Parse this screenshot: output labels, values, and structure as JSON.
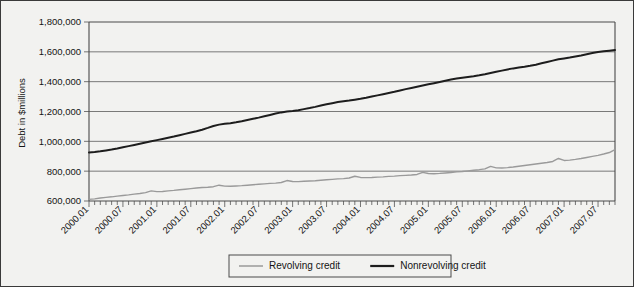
{
  "chart_data": {
    "type": "line",
    "title": "",
    "xlabel": "",
    "ylabel": "Debt in $millions",
    "ylim": [
      600000,
      1800000
    ],
    "yticks": [
      600000,
      800000,
      1000000,
      1200000,
      1400000,
      1600000,
      1800000
    ],
    "ytick_labels": [
      "600,000",
      "800,000",
      "1,000,000",
      "1,200,000",
      "1,400,000",
      "1,600,000",
      "1,800,000"
    ],
    "grid": true,
    "legend_position": "bottom-center",
    "x_tick_interval_months": 6,
    "x_minor_tick_interval_months": 1,
    "xtick_labels": [
      "2000.01",
      "2000.07",
      "2001.01",
      "2001.07",
      "2002.01",
      "2002.07",
      "2003.01",
      "2003.07",
      "2004.01",
      "2004.07",
      "2005.01",
      "2005.07",
      "2006.01",
      "2006.07",
      "2007.01",
      "2007.07"
    ],
    "x": [
      "2000.01",
      "2000.02",
      "2000.03",
      "2000.04",
      "2000.05",
      "2000.06",
      "2000.07",
      "2000.08",
      "2000.09",
      "2000.10",
      "2000.11",
      "2000.12",
      "2001.01",
      "2001.02",
      "2001.03",
      "2001.04",
      "2001.05",
      "2001.06",
      "2001.07",
      "2001.08",
      "2001.09",
      "2001.10",
      "2001.11",
      "2001.12",
      "2002.01",
      "2002.02",
      "2002.03",
      "2002.04",
      "2002.05",
      "2002.06",
      "2002.07",
      "2002.08",
      "2002.09",
      "2002.10",
      "2002.11",
      "2002.12",
      "2003.01",
      "2003.02",
      "2003.03",
      "2003.04",
      "2003.05",
      "2003.06",
      "2003.07",
      "2003.08",
      "2003.09",
      "2003.10",
      "2003.11",
      "2003.12",
      "2004.01",
      "2004.02",
      "2004.03",
      "2004.04",
      "2004.05",
      "2004.06",
      "2004.07",
      "2004.08",
      "2004.09",
      "2004.10",
      "2004.11",
      "2004.12",
      "2005.01",
      "2005.02",
      "2005.03",
      "2005.04",
      "2005.05",
      "2005.06",
      "2005.07",
      "2005.08",
      "2005.09",
      "2005.10",
      "2005.11",
      "2005.12",
      "2006.01",
      "2006.02",
      "2006.03",
      "2006.04",
      "2006.05",
      "2006.06",
      "2006.07",
      "2006.08",
      "2006.09",
      "2006.10",
      "2006.11",
      "2006.12",
      "2007.01",
      "2007.02",
      "2007.03",
      "2007.04",
      "2007.05",
      "2007.06",
      "2007.07",
      "2007.08",
      "2007.09",
      "2007.10"
    ],
    "series": [
      {
        "name": "Revolving credit",
        "color": "#9a9a9a",
        "values": [
          611000,
          614000,
          620000,
          624000,
          628000,
          633000,
          637000,
          641000,
          646000,
          650000,
          656000,
          668000,
          663000,
          664000,
          668000,
          671000,
          675000,
          679000,
          683000,
          687000,
          690000,
          692000,
          696000,
          706000,
          700000,
          699000,
          701000,
          703000,
          706000,
          709000,
          712000,
          715000,
          718000,
          720000,
          724000,
          737000,
          731000,
          730000,
          732000,
          734000,
          736000,
          739000,
          742000,
          745000,
          748000,
          750000,
          754000,
          766000,
          758000,
          757000,
          758000,
          760000,
          762000,
          765000,
          767000,
          770000,
          772000,
          774000,
          778000,
          792000,
          784000,
          783000,
          785000,
          788000,
          791000,
          795000,
          798000,
          802000,
          806000,
          810000,
          815000,
          832000,
          822000,
          821000,
          824000,
          828000,
          833000,
          838000,
          843000,
          848000,
          853000,
          858000,
          865000,
          885000,
          872000,
          874000,
          879000,
          885000,
          892000,
          899000,
          906000,
          915000,
          925000,
          945000
        ]
      },
      {
        "name": "Nonrevolving credit",
        "color": "#1d1d1d",
        "values": [
          925000,
          928000,
          933000,
          939000,
          945000,
          952000,
          960000,
          968000,
          976000,
          984000,
          992000,
          1000000,
          1008000,
          1016000,
          1024000,
          1032000,
          1041000,
          1050000,
          1059000,
          1068000,
          1078000,
          1090000,
          1103000,
          1112000,
          1118000,
          1122000,
          1128000,
          1135000,
          1143000,
          1151000,
          1159000,
          1168000,
          1177000,
          1186000,
          1194000,
          1200000,
          1204000,
          1209000,
          1216000,
          1223000,
          1231000,
          1240000,
          1248000,
          1256000,
          1263000,
          1268000,
          1273000,
          1279000,
          1285000,
          1292000,
          1300000,
          1308000,
          1316000,
          1324000,
          1332000,
          1341000,
          1350000,
          1358000,
          1366000,
          1374000,
          1382000,
          1390000,
          1398000,
          1406000,
          1414000,
          1421000,
          1427000,
          1432000,
          1437000,
          1443000,
          1450000,
          1458000,
          1466000,
          1474000,
          1482000,
          1489000,
          1495000,
          1500000,
          1506000,
          1514000,
          1523000,
          1532000,
          1541000,
          1550000,
          1556000,
          1562000,
          1569000,
          1576000,
          1584000,
          1592000,
          1599000,
          1604000,
          1608000,
          1612000
        ]
      }
    ]
  },
  "legend": {
    "items": [
      {
        "label": "Revolving credit",
        "color": "#9a9a9a"
      },
      {
        "label": "Nonrevolving credit",
        "color": "#1d1d1d"
      }
    ]
  }
}
